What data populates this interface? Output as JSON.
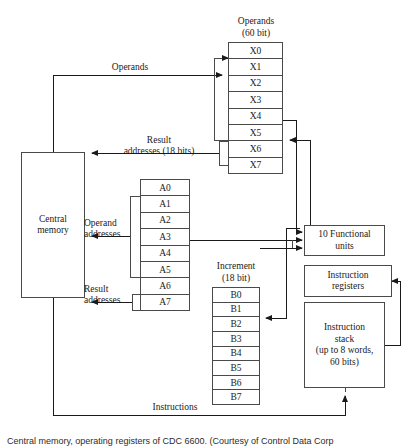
{
  "figure": {
    "caption_number": "",
    "caption_text": "Central memory, operating registers of CDC 6600. (Courtesy of Control Data Corp"
  },
  "blocks": {
    "central_memory": {
      "line1": "Central",
      "line2": "memory"
    },
    "functional_units": {
      "line1": "10 Functional",
      "line2": "units"
    },
    "instruction_registers": {
      "line1": "Instruction",
      "line2": "registers"
    },
    "instruction_stack": {
      "line1": "Instruction",
      "line2": "stack",
      "line3": "(up to 8 words,",
      "line4": "60 bits)"
    }
  },
  "register_files": {
    "operands": {
      "title_line1": "Operands",
      "title_line2": "(60 bit)",
      "registers": [
        "X0",
        "X1",
        "X2",
        "X3",
        "X4",
        "X5",
        "X6",
        "X7"
      ]
    },
    "addresses": {
      "title_line1": "",
      "title_line2": "",
      "registers": [
        "A0",
        "A1",
        "A2",
        "A3",
        "A4",
        "A5",
        "A6",
        "A7"
      ]
    },
    "increment": {
      "title_line1": "Increment",
      "title_line2": "(18 bit)",
      "registers": [
        "B0",
        "B1",
        "B2",
        "B3",
        "B4",
        "B5",
        "B6",
        "B7"
      ]
    }
  },
  "edge_labels": {
    "operands": "Operands",
    "result_addresses_18": {
      "line1": "Result",
      "line2": "addresses (18 bits)"
    },
    "operand_addresses": {
      "line1": "Operand",
      "line2": "addresses"
    },
    "result_addresses": {
      "line1": "Result",
      "line2": "addresses"
    },
    "instructions": "Instructions"
  },
  "colors": {
    "stroke": "#4a4a4a",
    "text": "#1a1a1a",
    "background": "#ffffff"
  }
}
